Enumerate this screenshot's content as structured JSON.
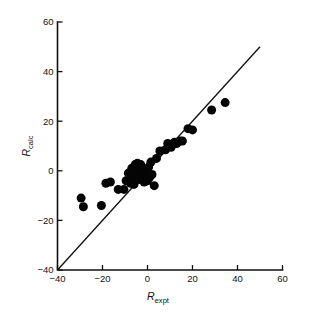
{
  "chart_data": {
    "type": "scatter",
    "title": "",
    "xlabel": "R_expt",
    "ylabel": "R_calc",
    "xlabel_var": "R",
    "xlabel_sub": "expt",
    "ylabel_var": "R",
    "ylabel_sub": "calc",
    "xlim": [
      -40,
      60
    ],
    "ylim": [
      -40,
      60
    ],
    "xticks": [
      -40,
      -20,
      0,
      20,
      40,
      60
    ],
    "yticks": [
      -40,
      -20,
      0,
      20,
      40,
      60
    ],
    "xtick_labels": [
      "−40",
      "−20",
      "0",
      "20",
      "40",
      "60"
    ],
    "ytick_labels": [
      "−40",
      "−20",
      "0",
      "20",
      "40",
      "60"
    ],
    "grid": false,
    "legend": false,
    "marker": "filled-circle",
    "marker_color": "#050505",
    "marker_size_px": 9,
    "reference_line": {
      "name": "identity-line",
      "type": "line",
      "equation": "y = x",
      "x": [
        -40,
        50
      ],
      "y": [
        -40,
        50
      ]
    },
    "points": [
      {
        "x": -29.5,
        "y": -11.0
      },
      {
        "x": -28.5,
        "y": -14.5
      },
      {
        "x": -20.5,
        "y": -14.0
      },
      {
        "x": -18.5,
        "y": -5.0
      },
      {
        "x": -16.5,
        "y": -4.5
      },
      {
        "x": -13.0,
        "y": -7.5
      },
      {
        "x": -10.5,
        "y": -7.5
      },
      {
        "x": -9.5,
        "y": -4.0
      },
      {
        "x": -8.5,
        "y": -1.0
      },
      {
        "x": -7.5,
        "y": -5.0
      },
      {
        "x": -7.0,
        "y": 1.0
      },
      {
        "x": -6.5,
        "y": -2.5
      },
      {
        "x": -6.0,
        "y": -5.5
      },
      {
        "x": -5.5,
        "y": 2.5
      },
      {
        "x": -5.0,
        "y": -1.5
      },
      {
        "x": -4.5,
        "y": 3.0
      },
      {
        "x": -4.0,
        "y": -3.5
      },
      {
        "x": -3.5,
        "y": 0.5
      },
      {
        "x": -3.0,
        "y": 2.5
      },
      {
        "x": -2.5,
        "y": -2.0
      },
      {
        "x": -2.0,
        "y": 1.0
      },
      {
        "x": -1.5,
        "y": -4.5
      },
      {
        "x": -1.0,
        "y": -1.0
      },
      {
        "x": 0.0,
        "y": -4.0
      },
      {
        "x": 0.5,
        "y": 1.5
      },
      {
        "x": 1.0,
        "y": -2.5
      },
      {
        "x": 1.5,
        "y": 3.5
      },
      {
        "x": 2.0,
        "y": -1.5
      },
      {
        "x": 3.0,
        "y": -6.0
      },
      {
        "x": 4.0,
        "y": 5.0
      },
      {
        "x": 5.5,
        "y": 8.0
      },
      {
        "x": 8.0,
        "y": 8.5
      },
      {
        "x": 9.0,
        "y": 11.0
      },
      {
        "x": 10.5,
        "y": 9.5
      },
      {
        "x": 12.0,
        "y": 11.5
      },
      {
        "x": 13.0,
        "y": 11.0
      },
      {
        "x": 14.5,
        "y": 12.0
      },
      {
        "x": 15.5,
        "y": 12.0
      },
      {
        "x": 18.0,
        "y": 17.0
      },
      {
        "x": 20.0,
        "y": 16.5
      },
      {
        "x": 28.5,
        "y": 24.5
      },
      {
        "x": 34.5,
        "y": 27.5
      }
    ]
  },
  "axes": {
    "x_axis_name": "x-axis",
    "y_axis_name": "y-axis"
  }
}
